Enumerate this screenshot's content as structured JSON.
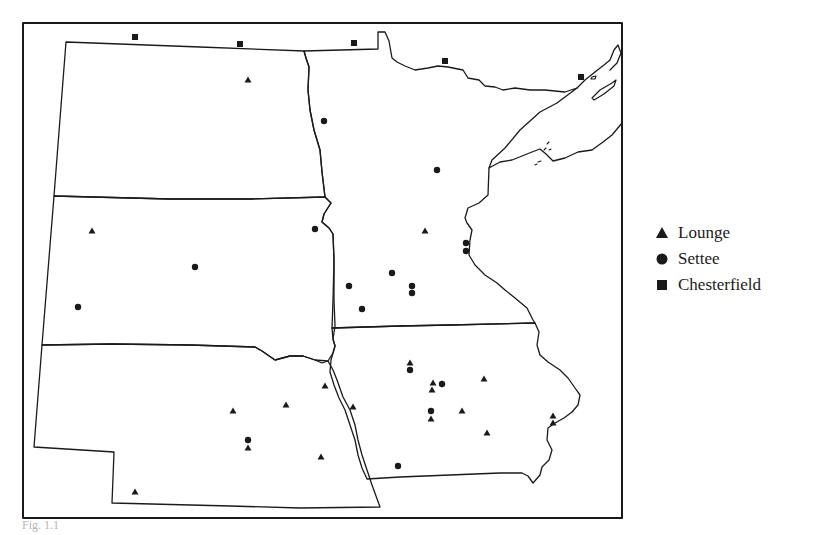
{
  "figure": {
    "caption_fragment": "Fig. 1.1"
  },
  "legend": {
    "items": [
      {
        "symbol": "triangle",
        "icon": "triangle-icon",
        "label": "Lounge"
      },
      {
        "symbol": "circle",
        "icon": "circle-icon",
        "label": "Settee"
      },
      {
        "symbol": "square",
        "icon": "square-icon",
        "label": "Chesterfield"
      }
    ]
  },
  "colors": {
    "ink": "#1a1a1a",
    "background": "#ffffff"
  },
  "map": {
    "region": "Upper Midwest (Dakotas, Nebraska, Minnesota, Iowa, Wisconsin)",
    "points": {
      "lounge": [
        [
          248,
          80
        ],
        [
          92,
          231
        ],
        [
          425,
          231
        ],
        [
          325,
          386
        ],
        [
          286,
          405
        ],
        [
          233,
          411
        ],
        [
          353,
          407
        ],
        [
          248,
          448
        ],
        [
          321,
          457
        ],
        [
          135,
          492
        ],
        [
          410,
          363
        ],
        [
          433,
          383
        ],
        [
          432,
          390
        ],
        [
          484,
          379
        ],
        [
          462,
          411
        ],
        [
          431,
          419
        ],
        [
          487,
          433
        ],
        [
          553,
          416
        ],
        [
          553,
          423
        ]
      ],
      "settee": [
        [
          324,
          121
        ],
        [
          437,
          170
        ],
        [
          315,
          229
        ],
        [
          195,
          267
        ],
        [
          78,
          307
        ],
        [
          466,
          243
        ],
        [
          466,
          251
        ],
        [
          392,
          273
        ],
        [
          349,
          286
        ],
        [
          412,
          286
        ],
        [
          412,
          293
        ],
        [
          362,
          309
        ],
        [
          410,
          370
        ],
        [
          442,
          384
        ],
        [
          431,
          411
        ],
        [
          398,
          466
        ],
        [
          248,
          440
        ]
      ],
      "chesterfield": [
        [
          135,
          37
        ],
        [
          240,
          44
        ],
        [
          354,
          43
        ],
        [
          445,
          61
        ],
        [
          581,
          77
        ]
      ]
    }
  }
}
